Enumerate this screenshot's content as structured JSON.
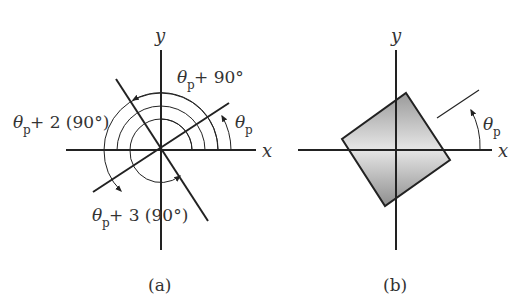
{
  "panel_a": {
    "caption": "(a)",
    "axis_x": "x",
    "axis_y": "y",
    "theta": "θ",
    "sub": "p",
    "label_90": " + 90°",
    "label_2_90": " + 2 (90°)",
    "label_3_90": " + 3 (90°)"
  },
  "panel_b": {
    "caption": "(b)",
    "axis_x": "x",
    "axis_y": "y",
    "theta": "θ",
    "sub": "p"
  }
}
